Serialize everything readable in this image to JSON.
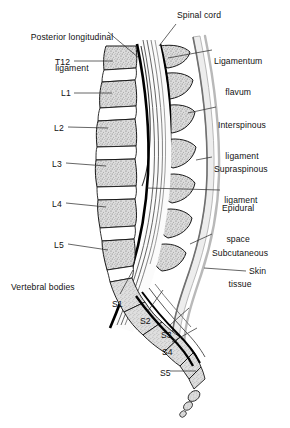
{
  "figure": {
    "kind": "anatomical-line-diagram",
    "view": "midsagittal section, lumbar and sacral spine, anterior to the left",
    "background_color": "#ffffff",
    "ink_color": "#111111",
    "bone_fill_color": "#d8d8d8",
    "disc_fill_color": "#ffffff",
    "skin_line_color": "#b4b4b4",
    "subcutaneous_fill_color": "#e8e8e8",
    "ligament_line_color": "#000000",
    "leader_line_color": "#3a3a3a"
  },
  "labels": {
    "posterior_longitudinal_ligament": {
      "text": "Posterior longitudinal\nligament",
      "line1": "Posterior longitudinal",
      "line2": "ligament",
      "side": "left-top",
      "x": 20,
      "y": 14,
      "align": "center"
    },
    "spinal_cord": {
      "text": "Spinal cord",
      "side": "right-top",
      "x": 177,
      "y": 12,
      "align": "left"
    },
    "ligamentum_flavum": {
      "text": "Ligamentum\nflavum",
      "line1": "Ligamentum",
      "line2": "flavum",
      "side": "right",
      "x": 214,
      "y": 38,
      "align": "left"
    },
    "interspinous_ligament": {
      "text": "Interspinous\nligament",
      "line1": "Interspinous",
      "line2": "ligament",
      "side": "right",
      "x": 218,
      "y": 101,
      "align": "left"
    },
    "supraspinous_ligament": {
      "text": "Supraspinous\nligament",
      "line1": "Supraspinous",
      "line2": "ligament",
      "side": "right",
      "x": 214,
      "y": 145,
      "align": "left"
    },
    "epidural_space": {
      "text": "Epidural\nspace",
      "line1": "Epidural",
      "line2": "space",
      "side": "right",
      "x": 222,
      "y": 184,
      "align": "left"
    },
    "subcutaneous_tissue": {
      "text": "Subcutaneous\ntissue",
      "line1": "Subcutaneous",
      "line2": "tissue",
      "side": "right",
      "x": 214,
      "y": 229,
      "align": "left"
    },
    "skin": {
      "text": "Skin",
      "side": "right",
      "x": 248,
      "y": 267,
      "align": "left"
    },
    "vertebral_bodies": {
      "text": "Vertebral bodies",
      "side": "left-bottom",
      "x": 11,
      "y": 283,
      "align": "left"
    }
  },
  "vertebrae": {
    "group_lumbar_label": "Vertebral bodies",
    "levels": [
      {
        "id": "T12",
        "label": "T12",
        "x": 55,
        "y": 57,
        "leader_to_x": 113,
        "leader_to_y": 62
      },
      {
        "id": "L1",
        "label": "L1",
        "x": 61,
        "y": 88,
        "leader_to_x": 112,
        "leader_to_y": 94
      },
      {
        "id": "L2",
        "label": "L2",
        "x": 54,
        "y": 123,
        "leader_to_x": 106,
        "leader_to_y": 126
      },
      {
        "id": "L3",
        "label": "L3",
        "x": 52,
        "y": 159,
        "leader_to_x": 104,
        "leader_to_y": 161
      },
      {
        "id": "L4",
        "label": "L4",
        "x": 52,
        "y": 199,
        "leader_to_x": 104,
        "leader_to_y": 200
      },
      {
        "id": "L5",
        "label": "L5",
        "x": 54,
        "y": 240,
        "leader_to_x": 108,
        "leader_to_y": 241
      },
      {
        "id": "S1",
        "label": "S1",
        "x": 112,
        "y": 299,
        "leader_to_x": 133,
        "leader_to_y": 272
      },
      {
        "id": "S2",
        "label": "S2",
        "x": 140,
        "y": 316,
        "leader_to_x": 163,
        "leader_to_y": 292
      },
      {
        "id": "S3",
        "label": "S3",
        "x": 161,
        "y": 330,
        "leader_to_x": 186,
        "leader_to_y": 310
      },
      {
        "id": "S4",
        "label": "S4",
        "x": 162,
        "y": 347,
        "leader_to_x": 196,
        "leader_to_y": 330
      },
      {
        "id": "S5",
        "label": "S5",
        "x": 160,
        "y": 368,
        "leader_to_x": 199,
        "leader_to_y": 369
      }
    ]
  },
  "structures": {
    "vertebral_bodies": "stippled bone blocks forming the anterior column, T12 through L5, separated by white intervertebral discs",
    "intervertebral_discs": "white lens-shaped gaps between adjacent vertebral bodies",
    "spinal_canal": "pale channel between the vertebral bodies and the spinous processes",
    "spinal_cord": "cord descending within the canal, tapering at the conus near L1-L2",
    "cauda_equina": "fine strands continuing caudally within the dural sac",
    "posterior_longitudinal_ligament": "thick black line on the posterior surface of the vertebral bodies",
    "ligamentum_flavum": "thick black line on the anterior surface of the laminae",
    "interspinous_ligament": "white bands filling the gaps between spinous processes",
    "supraspinous_ligament": "band running along the tips of the spinous processes",
    "epidural_space": "narrow space inside the canal, outside the dura",
    "subcutaneous_tissue": "pale gray layer outside the supraspinous ligament",
    "skin": "outermost light gray contour line",
    "sacrum": "fused sacral segments S1 through S5 curving posteroinferiorly",
    "coccyx": "small terminal segments at the inferior tip"
  }
}
